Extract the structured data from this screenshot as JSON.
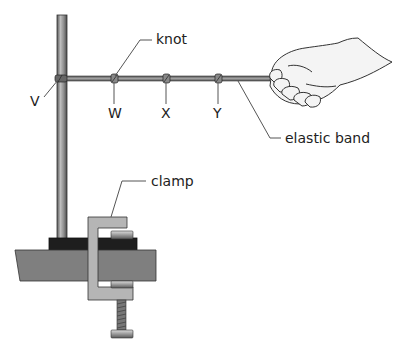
{
  "labels": {
    "knot": "knot",
    "v": "V",
    "w": "W",
    "x": "X",
    "y": "Y",
    "elastic_band": "elastic band",
    "clamp": "clamp"
  },
  "colors": {
    "pole": "#8a8a8a",
    "band": "#7d7d7d",
    "table": "#7f7f7f",
    "base": "#1e1e1e",
    "clamp": "#b5b5b5",
    "leader_line": "#555555"
  }
}
